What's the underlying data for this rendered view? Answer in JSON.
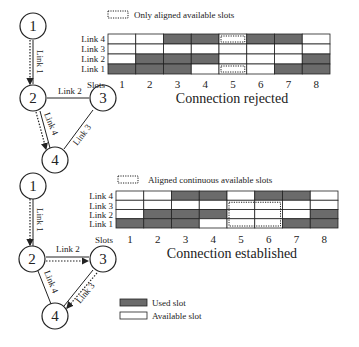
{
  "colors": {
    "used": "#6b6b6b",
    "available": "#ffffff",
    "line": "#222222"
  },
  "top": {
    "legend_label": "Only aligned available slots",
    "title": "Connection rejected",
    "link_labels": [
      "Link 4",
      "Link 3",
      "Link 2",
      "Link 1"
    ],
    "slots_label": "Slots",
    "slots": [
      "1",
      "2",
      "3",
      "4",
      "5",
      "6",
      "7",
      "8"
    ],
    "grid": [
      [
        0,
        0,
        1,
        1,
        0,
        1,
        1,
        0
      ],
      [
        0,
        0,
        0,
        0,
        0,
        0,
        0,
        0
      ],
      [
        0,
        1,
        1,
        1,
        0,
        0,
        0,
        1
      ],
      [
        1,
        1,
        1,
        0,
        0,
        0,
        1,
        1
      ]
    ],
    "graph": {
      "nodes": [
        "1",
        "2",
        "3",
        "4"
      ],
      "edges": [
        "Link 1",
        "Link 2",
        "Link 3",
        "Link 4"
      ]
    }
  },
  "bottom": {
    "legend_label": "Aligned continuous available slots",
    "title": "Connection established",
    "link_labels": [
      "Link 4",
      "Link 3",
      "Link 2",
      "Link 1"
    ],
    "slots_label": "Slots",
    "slots": [
      "1",
      "2",
      "3",
      "4",
      "5",
      "6",
      "7",
      "8"
    ],
    "grid": [
      [
        0,
        0,
        1,
        1,
        0,
        1,
        1,
        0
      ],
      [
        0,
        0,
        0,
        0,
        0,
        0,
        0,
        0
      ],
      [
        0,
        1,
        1,
        1,
        0,
        0,
        0,
        1
      ],
      [
        1,
        1,
        1,
        0,
        0,
        0,
        1,
        1
      ]
    ],
    "graph": {
      "nodes": [
        "1",
        "2",
        "3",
        "4"
      ],
      "edges": [
        "Link 1",
        "Link 2",
        "Link 3",
        "Link 4"
      ]
    }
  },
  "legend": {
    "used": "Used slot",
    "available": "Available slot"
  }
}
